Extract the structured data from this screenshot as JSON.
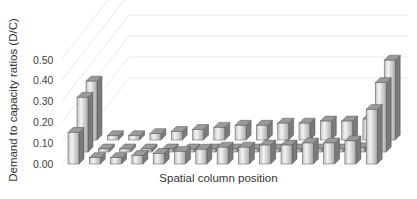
{
  "chart_data": {
    "type": "bar",
    "subtype": "3d-bar",
    "title": "",
    "xlabel": "Spatial column position",
    "ylabel": "Demand to capacity ratios  (D/C)",
    "yticks": [
      "0.00",
      "0.10",
      "0.20",
      "0.30",
      "0.40",
      "0.50"
    ],
    "ylim": [
      0,
      0.5
    ],
    "grid": true,
    "legend": null,
    "categories": [
      1,
      2,
      3,
      4,
      5,
      6,
      7,
      8,
      9,
      10,
      11,
      12,
      13,
      14,
      15
    ],
    "series": [
      {
        "name": "front row",
        "values": [
          0.15,
          0.03,
          0.03,
          0.04,
          0.05,
          0.06,
          0.07,
          0.08,
          0.08,
          0.09,
          0.09,
          0.1,
          0.1,
          0.11,
          0.26
        ]
      },
      {
        "name": "middle row",
        "values": [
          0.26,
          0.01,
          0.01,
          0.01,
          0.01,
          0.01,
          0.01,
          0.01,
          0.01,
          0.01,
          0.01,
          0.01,
          0.01,
          0.02,
          0.33
        ]
      },
      {
        "name": "back row",
        "values": [
          0.28,
          0.02,
          0.02,
          0.03,
          0.04,
          0.05,
          0.06,
          0.07,
          0.07,
          0.08,
          0.08,
          0.09,
          0.09,
          0.1,
          0.38
        ]
      }
    ]
  }
}
